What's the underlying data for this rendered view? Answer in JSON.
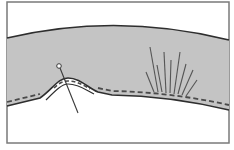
{
  "diagram": {
    "colors": {
      "background": "#ffffff",
      "frame": "#7a7a7a",
      "fabric": "#c4c4c4",
      "outline": "#2e2e2e",
      "stitch": "#4a4a4a",
      "pin": "#3a3a3a",
      "press_lines": "#555555"
    },
    "elements": {
      "frame": {
        "x": 7,
        "y": 2,
        "w": 222,
        "h": 141
      },
      "fabric_top_edge": "M7 38 Q117 12 229 40",
      "fabric_bottom_edge": "M7 106 L40 98 C52 90 58 78 68 78 C80 78 88 88 98 92 L112 95 Q170 96 229 110",
      "stitch_line": "M7 102 L40 94 M98 88 L112 91 Q170 92 229 105",
      "bump_inner_stitch": "M52 92 C58 84 62 82 68 82 C78 82 84 86 92 90",
      "bump_fold": "M48 96 C56 86 62 80 68 80 C80 80 88 88 96 92",
      "pin": {
        "head": [
          59,
          66
        ],
        "tip": [
          78,
          113
        ]
      },
      "press_lines": [
        {
          "x1": 150,
          "y1": 47,
          "x2": 158,
          "y2": 92
        },
        {
          "x1": 157,
          "y1": 65,
          "x2": 162,
          "y2": 92
        },
        {
          "x1": 164,
          "y1": 52,
          "x2": 166,
          "y2": 93
        },
        {
          "x1": 171,
          "y1": 60,
          "x2": 170,
          "y2": 93
        },
        {
          "x1": 180,
          "y1": 52,
          "x2": 174,
          "y2": 94
        },
        {
          "x1": 186,
          "y1": 64,
          "x2": 178,
          "y2": 94
        },
        {
          "x1": 193,
          "y1": 70,
          "x2": 182,
          "y2": 95
        },
        {
          "x1": 197,
          "y1": 80,
          "x2": 186,
          "y2": 96
        },
        {
          "x1": 146,
          "y1": 72,
          "x2": 154,
          "y2": 92
        }
      ]
    }
  }
}
